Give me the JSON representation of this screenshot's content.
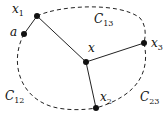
{
  "diagram": {
    "nodes": [
      {
        "id": "x",
        "label": "x",
        "sub": "",
        "cx": 86,
        "cy": 62
      },
      {
        "id": "x1",
        "label": "x",
        "sub": "1",
        "cx": 37,
        "cy": 16
      },
      {
        "id": "x2",
        "label": "x",
        "sub": "2",
        "cx": 96,
        "cy": 108
      },
      {
        "id": "x3",
        "label": "x",
        "sub": "3",
        "cx": 144,
        "cy": 43
      },
      {
        "id": "a",
        "label": "a",
        "sub": "",
        "cx": 24,
        "cy": 34
      }
    ],
    "curves": [
      {
        "label": "C",
        "sub": "13"
      },
      {
        "label": "C",
        "sub": "12"
      },
      {
        "label": "C",
        "sub": "23"
      }
    ]
  }
}
